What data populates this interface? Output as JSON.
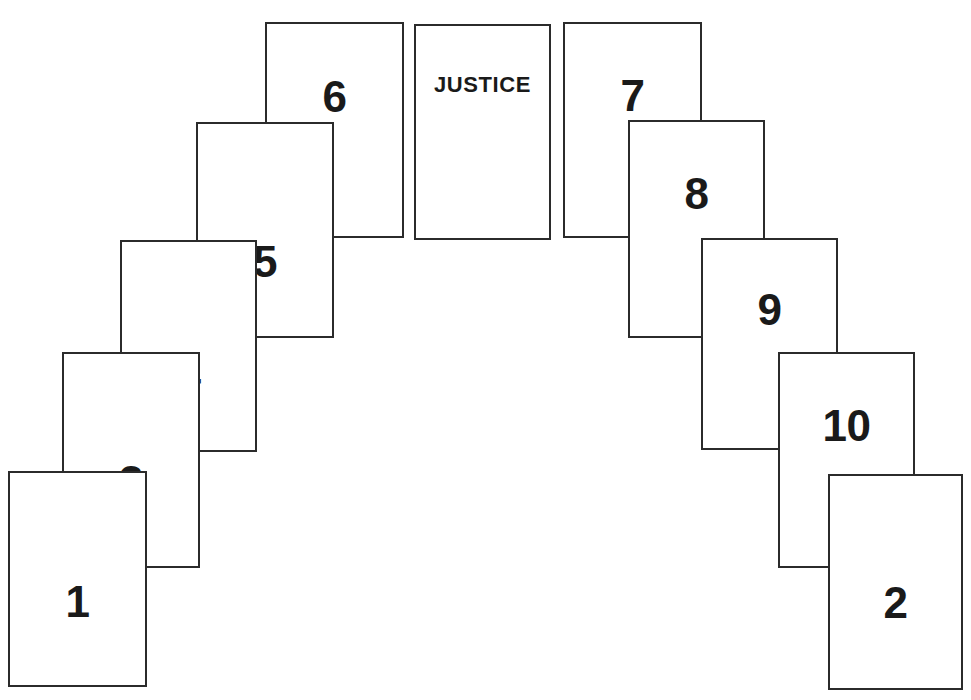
{
  "spread": {
    "name": "tarot-arch-spread",
    "background_color": "#ffffff",
    "card_border_color": "#2b2b2b",
    "label_color": "#1a1a1a",
    "cards": [
      {
        "id": "card-1",
        "label": "1",
        "label_type": "number",
        "x": 8,
        "y": 471,
        "w": 139,
        "h": 216,
        "z": 10,
        "label_top": 107
      },
      {
        "id": "card-3",
        "label": "3",
        "label_type": "number",
        "x": 62,
        "y": 352,
        "w": 138,
        "h": 216,
        "z": 9,
        "label_top": 106
      },
      {
        "id": "card-4",
        "label": "4",
        "label_type": "number",
        "x": 120,
        "y": 240,
        "w": 137,
        "h": 212,
        "z": 8,
        "label_top": 111
      },
      {
        "id": "card-5",
        "label": "5",
        "label_type": "number",
        "x": 196,
        "y": 122,
        "w": 138,
        "h": 216,
        "z": 7,
        "label_top": 116
      },
      {
        "id": "card-6",
        "label": "6",
        "label_type": "number",
        "x": 265,
        "y": 22,
        "w": 139,
        "h": 216,
        "z": 6,
        "label_top": 51
      },
      {
        "id": "card-justice",
        "label": "JUSTICE",
        "label_type": "title",
        "x": 414,
        "y": 24,
        "w": 137,
        "h": 216,
        "z": 5,
        "label_top": 48
      },
      {
        "id": "card-7",
        "label": "7",
        "label_type": "number",
        "x": 563,
        "y": 22,
        "w": 139,
        "h": 216,
        "z": 4,
        "label_top": 50
      },
      {
        "id": "card-8",
        "label": "8",
        "label_type": "number",
        "x": 628,
        "y": 120,
        "w": 137,
        "h": 218,
        "z": 5,
        "label_top": 50
      },
      {
        "id": "card-9",
        "label": "9",
        "label_type": "number",
        "x": 701,
        "y": 238,
        "w": 137,
        "h": 212,
        "z": 6,
        "label_top": 48
      },
      {
        "id": "card-10",
        "label": "10",
        "label_type": "number",
        "x": 778,
        "y": 352,
        "w": 137,
        "h": 216,
        "z": 7,
        "label_top": 50
      },
      {
        "id": "card-2",
        "label": "2",
        "label_type": "number",
        "x": 828,
        "y": 474,
        "w": 135,
        "h": 216,
        "z": 8,
        "label_top": 105
      }
    ]
  }
}
